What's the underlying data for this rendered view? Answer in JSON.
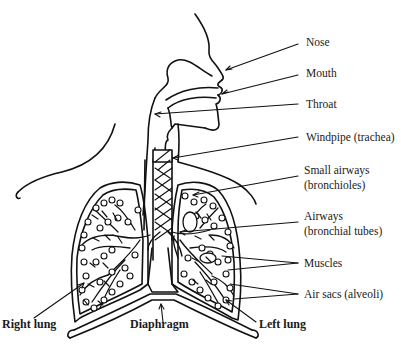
{
  "diagram": {
    "labels": {
      "nose": "Nose",
      "mouth": "Mouth",
      "throat": "Throat",
      "windpipe": "Windpipe (trachea)",
      "small_airways_1": "Small airways",
      "small_airways_2": "(bronchioles)",
      "airways_1": "Airways",
      "airways_2": "(bronchial tubes)",
      "muscles": "Muscles",
      "air_sacs": "Air sacs (alveoli)",
      "right_lung": "Right lung",
      "diaphragm": "Diaphragm",
      "left_lung": "Left lung"
    },
    "colors": {
      "ink": "#111111",
      "background": "#ffffff"
    }
  }
}
